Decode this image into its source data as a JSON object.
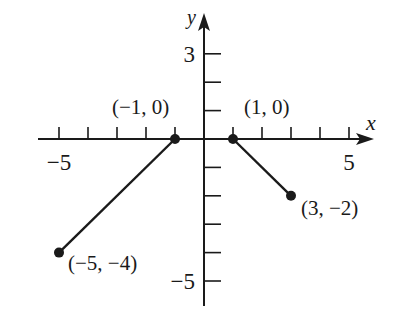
{
  "chart_data": {
    "type": "line",
    "title": "",
    "xlabel": "x",
    "ylabel": "y",
    "xlim": [
      -6,
      6
    ],
    "ylim": [
      -6,
      4
    ],
    "grid": false,
    "x_tick_labels": [
      {
        "value": -5,
        "label": "−5"
      },
      {
        "value": 5,
        "label": "5"
      }
    ],
    "y_tick_labels": [
      {
        "value": 3,
        "label": "3"
      },
      {
        "value": -5,
        "label": "−5"
      }
    ],
    "x_ticks": [
      -5,
      -4,
      -3,
      -2,
      -1,
      1,
      2,
      3,
      4,
      5
    ],
    "y_ticks": [
      3,
      2,
      1,
      -1,
      -2,
      -3,
      -4,
      -5
    ],
    "series": [
      {
        "name": "segment-left",
        "points": [
          [
            -5,
            -4
          ],
          [
            -1,
            0
          ]
        ]
      },
      {
        "name": "segment-right",
        "points": [
          [
            1,
            0
          ],
          [
            3,
            -2
          ]
        ]
      }
    ],
    "annotations": [
      {
        "point": [
          -1,
          0
        ],
        "label": "(−1, 0)"
      },
      {
        "point": [
          1,
          0
        ],
        "label": "(1, 0)"
      },
      {
        "point": [
          -5,
          -4
        ],
        "label": "(−5, −4)"
      },
      {
        "point": [
          3,
          -2
        ],
        "label": "(3, −2)"
      }
    ],
    "colors": {
      "line": "#1a1a1a",
      "background": "#ffffff"
    }
  }
}
